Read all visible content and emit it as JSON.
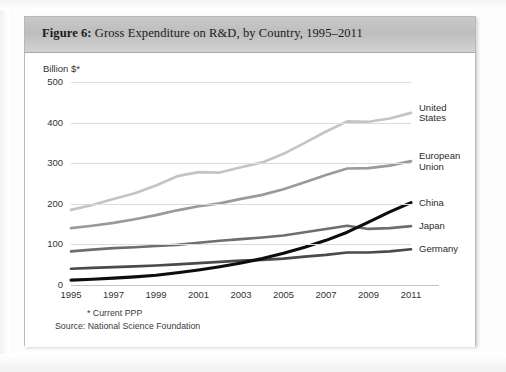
{
  "figure": {
    "label": "Figure 6:",
    "title": "Gross Expenditure on R&D, by Country, 1995–2011"
  },
  "axis": {
    "y_title": "Billion $*",
    "y_ticks": [
      "500",
      "400",
      "300",
      "200",
      "100",
      "0"
    ],
    "x_ticks": [
      "1995",
      "1997",
      "1999",
      "2001",
      "2003",
      "2005",
      "2007",
      "2009",
      "2011"
    ]
  },
  "footnotes": {
    "ppp": "* Current PPP",
    "source": "Source: National Science Foundation"
  },
  "series_labels": {
    "united_states_line1": "United",
    "united_states_line2": "States",
    "european_union_line1": "European",
    "european_union_line2": "Union",
    "china": "China",
    "japan": "Japan",
    "germany": "Germany"
  },
  "colors": {
    "united_states": "#c4c4c4",
    "european_union": "#9a9a9a",
    "japan": "#6e6e6e",
    "germany": "#4a4a4a",
    "china": "#0d0d0d",
    "grid": "#dcdcdc",
    "header_band": "#c4c4c4",
    "card_border": "#b9b9b9"
  },
  "chart_data": {
    "type": "line",
    "title": "Gross Expenditure on R&D, by Country, 1995–2011",
    "xlabel": "",
    "ylabel": "Billion $*",
    "ylim": [
      0,
      500
    ],
    "xlim": [
      1995,
      2011
    ],
    "grid": true,
    "legend_position": "right-inline",
    "x": [
      1995,
      1996,
      1997,
      1998,
      1999,
      2000,
      2001,
      2002,
      2003,
      2004,
      2005,
      2006,
      2007,
      2008,
      2009,
      2010,
      2011
    ],
    "series": [
      {
        "name": "United States",
        "color": "#c4c4c4",
        "values": [
          185,
          197,
          212,
          226,
          245,
          268,
          278,
          277,
          290,
          302,
          323,
          350,
          378,
          403,
          402,
          410,
          424
        ]
      },
      {
        "name": "European Union",
        "color": "#9a9a9a",
        "values": [
          140,
          146,
          153,
          162,
          172,
          184,
          194,
          201,
          212,
          222,
          236,
          253,
          271,
          287,
          288,
          294,
          305
        ]
      },
      {
        "name": "Japan",
        "color": "#6e6e6e",
        "values": [
          83,
          87,
          91,
          93,
          96,
          99,
          104,
          109,
          113,
          117,
          122,
          130,
          138,
          146,
          138,
          140,
          145
        ]
      },
      {
        "name": "Germany",
        "color": "#4a4a4a",
        "values": [
          40,
          42,
          44,
          46,
          48,
          51,
          54,
          57,
          60,
          62,
          65,
          70,
          74,
          80,
          80,
          83,
          88
        ]
      },
      {
        "name": "China",
        "color": "#0d0d0d",
        "values": [
          12,
          14,
          17,
          20,
          24,
          30,
          37,
          45,
          54,
          65,
          78,
          93,
          110,
          130,
          155,
          180,
          203
        ]
      }
    ],
    "annotations": [
      "China overtakes Germany around 2003",
      "China overtakes Japan around 2009"
    ]
  }
}
